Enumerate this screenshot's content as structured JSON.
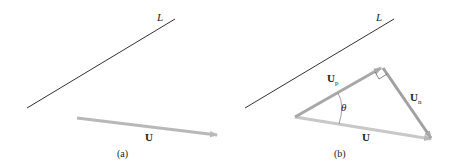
{
  "panels": [
    {
      "id": "a",
      "caption": "(a)",
      "line_label": "L",
      "vector_label": "U"
    },
    {
      "id": "b",
      "caption": "(b)",
      "line_label": "L",
      "vector_label": "U",
      "projection_label_main": "U",
      "projection_label_sub": "p",
      "normal_label_main": "U",
      "normal_label_sub": "n",
      "angle_label": "θ"
    }
  ],
  "colors": {
    "line": "#333333",
    "vector": "#b8b8b8",
    "projection": "#a8a8a8",
    "normal": "#a0a0a0",
    "text": "#222222"
  }
}
